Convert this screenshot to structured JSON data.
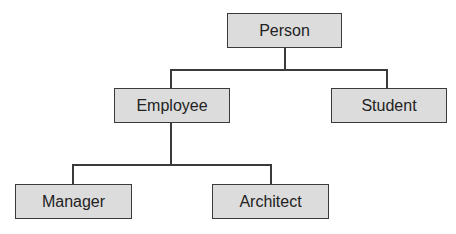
{
  "diagram": {
    "type": "class-hierarchy",
    "nodes": {
      "person": {
        "label": "Person"
      },
      "employee": {
        "label": "Employee"
      },
      "student": {
        "label": "Student"
      },
      "manager": {
        "label": "Manager"
      },
      "architect": {
        "label": "Architect"
      }
    },
    "edges": [
      {
        "from": "Person",
        "to": "Employee"
      },
      {
        "from": "Person",
        "to": "Student"
      },
      {
        "from": "Employee",
        "to": "Manager"
      },
      {
        "from": "Employee",
        "to": "Architect"
      }
    ],
    "colors": {
      "box_fill": "#dcdcdc",
      "box_border": "#3a3a3a",
      "line": "#3a3a3a"
    }
  }
}
